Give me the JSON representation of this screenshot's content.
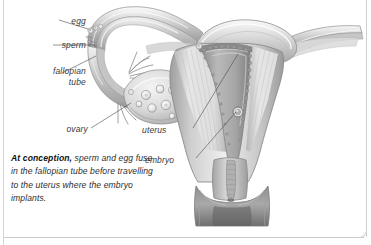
{
  "illustration": {
    "title": "female reproductive system at conception",
    "view": "coronal cross-section of uterus, fallopian tubes and ovary",
    "style": "greyscale medical airbrush illustration",
    "colors": {
      "background": "#ffffff",
      "outline": "#7d7d7d",
      "tissue_light": "#e8e8e8",
      "tissue_mid": "#c2c2c2",
      "tissue_dark": "#9a9a9a",
      "lining_dark": "#8a8a8a",
      "cavity_shadow": "#6f6f6f",
      "leader_line": "#555555",
      "frame": "#cfcfcf"
    },
    "parts": [
      "fallopian tube",
      "fimbriae",
      "ovary with follicles",
      "uterine fundus",
      "endometrium",
      "uterine cavity",
      "myometrium",
      "cervix",
      "cervical canal",
      "vagina",
      "egg",
      "sperm",
      "embryo"
    ]
  },
  "labels": {
    "egg": "egg",
    "sperm": "sperm",
    "fallopian_tube_line1": "fallopian",
    "fallopian_tube_line2": "tube",
    "ovary": "ovary",
    "uterus": "uterus",
    "embryo": "embryo"
  },
  "caption": {
    "lead": "At conception,",
    "body": " sperm and egg fuse in the fallopian tube before travelling to the uterus where the embryo implants."
  }
}
